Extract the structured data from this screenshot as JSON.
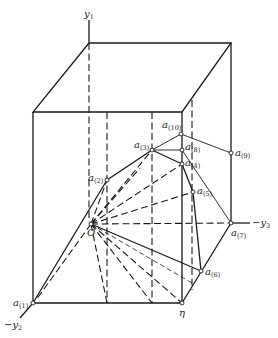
{
  "figure": {
    "axes": {
      "y1": {
        "label": "y",
        "sub": "1"
      },
      "y2": {
        "label": "−y",
        "sub": "2"
      },
      "y3": {
        "label": "−y",
        "sub": "3"
      }
    },
    "origin": {
      "label": "O"
    },
    "eta": {
      "label": "η"
    },
    "points": [
      {
        "id": "a1",
        "label": "a",
        "sub": "(1)"
      },
      {
        "id": "a2",
        "label": "a",
        "sub": "(2)"
      },
      {
        "id": "a3",
        "label": "a",
        "sub": "(3)"
      },
      {
        "id": "a4",
        "label": "a",
        "sub": "(4)"
      },
      {
        "id": "a5",
        "label": "a",
        "sub": "(5)"
      },
      {
        "id": "a6",
        "label": "a",
        "sub": "(6)"
      },
      {
        "id": "a7",
        "label": "a",
        "sub": "(7)"
      },
      {
        "id": "a8",
        "label": "a",
        "sub": "(8)"
      },
      {
        "id": "a9",
        "label": "a",
        "sub": "(9)"
      },
      {
        "id": "a10",
        "label": "a",
        "sub": "(10)"
      }
    ]
  }
}
